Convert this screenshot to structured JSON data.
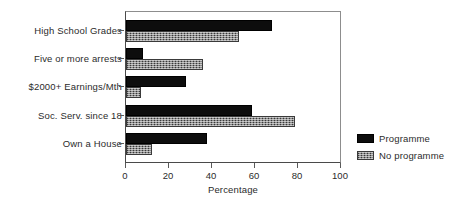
{
  "chart_data": {
    "type": "bar",
    "orientation": "horizontal",
    "title": "",
    "xlabel": "Percentage",
    "ylabel": "",
    "xlim": [
      0,
      100
    ],
    "xticks": [
      0,
      20,
      40,
      60,
      80,
      100
    ],
    "xtick_labels": [
      "0",
      "20",
      "40",
      "60",
      "80",
      "100"
    ],
    "grid": false,
    "legend_position": "right",
    "categories": [
      "High School Grades",
      "Five or more arrests",
      "$2000+ Earnings/Mth",
      "Soc. Serv. since 18",
      "Own a House"
    ],
    "series": [
      {
        "name": "Programme",
        "color": "#0d0d0d",
        "pattern": "solid",
        "values": [
          68,
          8,
          28,
          59,
          38
        ]
      },
      {
        "name": "No programme",
        "color": "#8a8a8a",
        "pattern": "hatched",
        "values": [
          53,
          36,
          7,
          79,
          12
        ]
      }
    ]
  },
  "legend": {
    "items": [
      {
        "label": "Programme"
      },
      {
        "label": "No programme"
      }
    ]
  },
  "axis": {
    "x_title": "Percentage"
  }
}
